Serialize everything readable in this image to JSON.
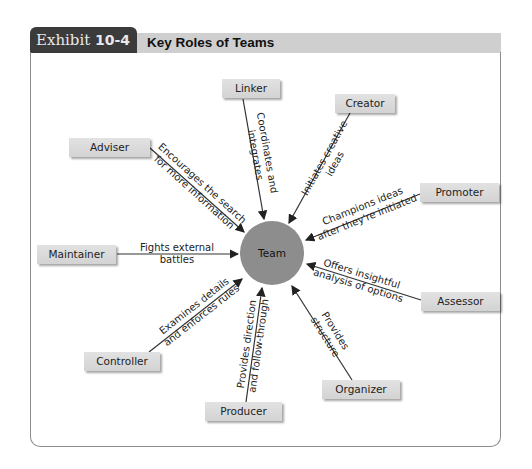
{
  "header": {
    "exhibit_word": "Exhibit",
    "exhibit_number": "10-4",
    "title": "Key Roles of Teams"
  },
  "center": {
    "label": "Team",
    "color": "#8d8d8d"
  },
  "roles": [
    {
      "name": "Linker",
      "description_line1": "Coordinates and",
      "description_line2": "integrates",
      "arrow_direction": "to-team"
    },
    {
      "name": "Creator",
      "description_line1": "Initiates creative",
      "description_line2": "ideas",
      "arrow_direction": "to-team"
    },
    {
      "name": "Promoter",
      "description_line1": "Champions ideas",
      "description_line2": "after they're initiated",
      "arrow_direction": "to-team"
    },
    {
      "name": "Assessor",
      "description_line1": "Offers insightful",
      "description_line2": "analysis of options",
      "arrow_direction": "to-team"
    },
    {
      "name": "Organizer",
      "description_line1": "Provides",
      "description_line2": "structure",
      "arrow_direction": "to-team"
    },
    {
      "name": "Producer",
      "description_line1": "Provides direction",
      "description_line2": "and follow-through",
      "arrow_direction": "to-team"
    },
    {
      "name": "Controller",
      "description_line1": "Examines details",
      "description_line2": "and enforces rules",
      "arrow_direction": "to-team"
    },
    {
      "name": "Maintainer",
      "description_line1": "Fights external",
      "description_line2": "battles",
      "arrow_direction": "to-team"
    },
    {
      "name": "Adviser",
      "description_line1": "Encourages the search",
      "description_line2": "for more information",
      "arrow_direction": "to-team"
    }
  ]
}
